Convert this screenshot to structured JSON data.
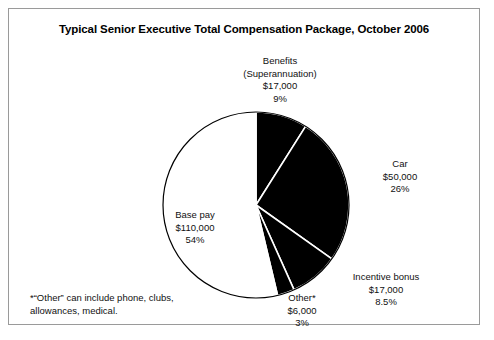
{
  "figure": {
    "title": "Typical Senior Executive Total Compensation Package, October 2006",
    "footnote_line1": "*“Other” can include phone, clubs,",
    "footnote_line2": "allowances, medical."
  },
  "chart_data": {
    "type": "pie",
    "title": "Typical Senior Executive Total Compensation Package, October 2006",
    "xlabel": "",
    "ylabel": "",
    "legend_position": "none",
    "grid": false,
    "start_angle_deg": 90,
    "direction": "clockwise",
    "total_value": 200000,
    "currency": "$",
    "categories": [
      "Benefits (Superannuation)",
      "Car",
      "Incentive bonus",
      "Other*",
      "Base pay"
    ],
    "values": [
      17000,
      50000,
      17000,
      6000,
      110000
    ],
    "percentages": [
      9,
      26,
      8.5,
      3,
      54
    ],
    "slice_colors": [
      "#000000",
      "#000000",
      "#000000",
      "#000000",
      "#ffffff"
    ],
    "separator_color": "#ffffff",
    "outline_color": "#000000",
    "slices": [
      {
        "name": "Benefits",
        "name_line2": "(Superannuation)",
        "value_label": "$17,000",
        "pct_label": "9%",
        "value": 17000,
        "percent": 9,
        "color": "#000000"
      },
      {
        "name": "Car",
        "name_line2": "",
        "value_label": "$50,000",
        "pct_label": "26%",
        "value": 50000,
        "percent": 26,
        "color": "#000000"
      },
      {
        "name": "Incentive bonus",
        "name_line2": "",
        "value_label": "$17,000",
        "pct_label": "8.5%",
        "value": 17000,
        "percent": 8.5,
        "color": "#000000"
      },
      {
        "name": "Other*",
        "name_line2": "",
        "value_label": "$6,000",
        "pct_label": "3%",
        "value": 6000,
        "percent": 3,
        "color": "#000000"
      },
      {
        "name": "Base pay",
        "name_line2": "",
        "value_label": "$110,000",
        "pct_label": "54%",
        "value": 110000,
        "percent": 54,
        "color": "#ffffff"
      }
    ]
  }
}
